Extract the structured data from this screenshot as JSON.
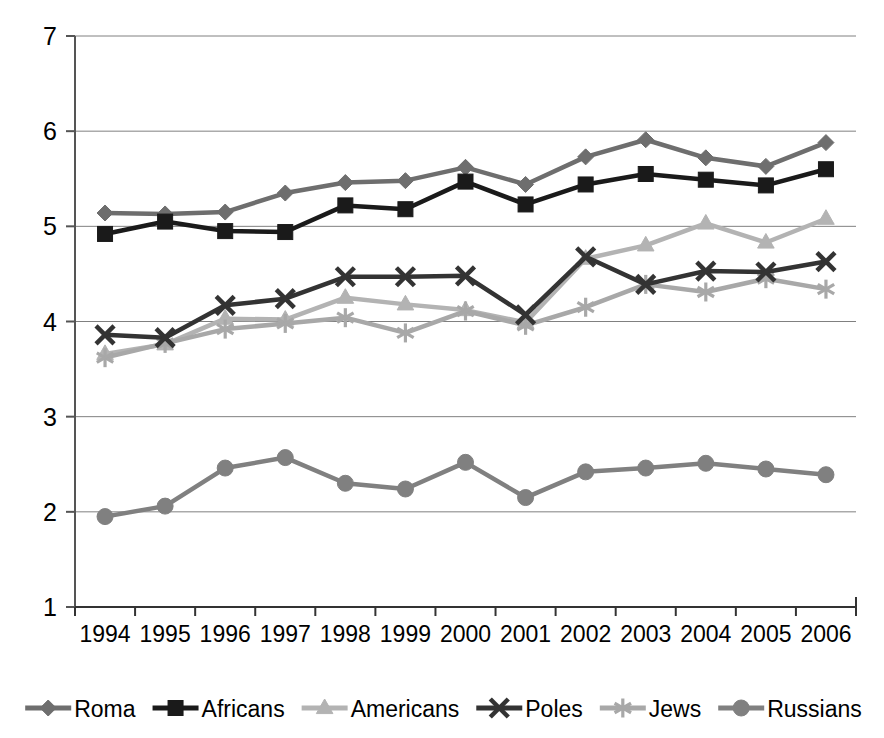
{
  "chart_data": {
    "type": "line",
    "title": "",
    "subtitle": "",
    "xlabel": "",
    "ylabel": "",
    "categories": [
      "1994",
      "1995",
      "1996",
      "1997",
      "1998",
      "1999",
      "2000",
      "2001",
      "2002",
      "2003",
      "2004",
      "2005",
      "2006"
    ],
    "ylim": [
      1,
      7
    ],
    "y_ticks": [
      "1",
      "2",
      "3",
      "4",
      "5",
      "6",
      "7"
    ],
    "grid": "horizontal",
    "legend_position": "bottom",
    "series": [
      {
        "name": "Roma",
        "marker": "diamond",
        "color": "#6e6e6e",
        "values": [
          5.14,
          5.13,
          5.15,
          5.35,
          5.46,
          5.48,
          5.62,
          5.44,
          5.73,
          5.91,
          5.72,
          5.63,
          5.88
        ]
      },
      {
        "name": "Africans",
        "marker": "square",
        "color": "#1a1a1a",
        "values": [
          4.92,
          5.05,
          4.95,
          4.94,
          5.22,
          5.18,
          5.47,
          5.23,
          5.44,
          5.55,
          5.49,
          5.43,
          5.6
        ]
      },
      {
        "name": "Americans",
        "marker": "triangle",
        "color": "#b3b3b3",
        "values": [
          3.66,
          3.76,
          4.03,
          4.02,
          4.25,
          4.18,
          4.12,
          3.99,
          4.66,
          4.8,
          5.03,
          4.83,
          5.08
        ]
      },
      {
        "name": "Poles",
        "marker": "cross",
        "color": "#333333",
        "values": [
          3.86,
          3.83,
          4.17,
          4.24,
          4.47,
          4.47,
          4.48,
          4.07,
          4.68,
          4.39,
          4.53,
          4.52,
          4.63
        ]
      },
      {
        "name": "Jews",
        "marker": "star",
        "color": "#a8a8a8",
        "values": [
          3.62,
          3.77,
          3.92,
          3.98,
          4.04,
          3.88,
          4.11,
          3.96,
          4.15,
          4.39,
          4.31,
          4.45,
          4.34
        ]
      },
      {
        "name": "Russians",
        "marker": "circle",
        "color": "#808080",
        "values": [
          1.95,
          2.06,
          2.46,
          2.57,
          2.3,
          2.24,
          2.52,
          2.15,
          2.42,
          2.46,
          2.51,
          2.45,
          2.39
        ]
      }
    ]
  },
  "axes": {
    "y_axis_name": "value-axis",
    "x_axis_name": "category-axis"
  }
}
